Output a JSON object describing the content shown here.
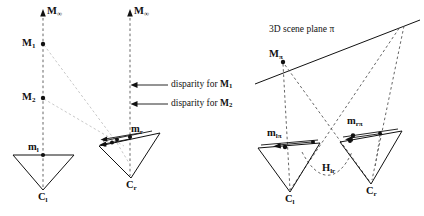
{
  "figure": {
    "background_color": "#ffffff",
    "line_color": "#111111",
    "dashed_color": "#555555",
    "faint_dashed_color": "#bbbbbb",
    "width": 424,
    "height": 216
  },
  "left_panel": {
    "labels": {
      "m_infinity_left": "M",
      "m_infinity_left_sub": "∞",
      "m_infinity_right": "M",
      "m_infinity_right_sub": "∞",
      "point_m1": "M",
      "point_m1_sub": "1",
      "point_m2": "M",
      "point_m2_sub": "2",
      "image_point_left": "m",
      "image_point_left_sub": "l",
      "image_point_right": "m",
      "image_point_right_sub": "r",
      "camera_left": "C",
      "camera_left_sub": "l",
      "camera_right": "C",
      "camera_right_sub": "r"
    },
    "annotations": [
      {
        "text": "disparity for ",
        "symbol": "M",
        "symbol_sub": "1"
      },
      {
        "text": "disparity for ",
        "symbol": "M",
        "symbol_sub": "2"
      }
    ]
  },
  "right_panel": {
    "labels": {
      "scene_plane": "3D scene plane π",
      "point_m_pi": "M",
      "point_m_pi_sub": "π",
      "image_point_lpi": "m",
      "image_point_lpi_sub": "lπ",
      "image_point_rpi": "m",
      "image_point_rpi_sub": "rπ",
      "homography": "H",
      "homography_sub": "lr",
      "camera_left": "C",
      "camera_left_sub": "l",
      "camera_right": "C",
      "camera_right_sub": "r"
    }
  },
  "geometry": {
    "left_panel": {
      "axis_left_x": 43,
      "axis_right_x": 130,
      "axis_top_y": 14,
      "camera_left_apex": [
        43,
        190
      ],
      "camera_right_apex": [
        131,
        178
      ],
      "m1": [
        43,
        44
      ],
      "m2": [
        43,
        98
      ],
      "ml": [
        43,
        154
      ],
      "mr": [
        130,
        137
      ]
    },
    "right_panel": {
      "m_pi": [
        283,
        62
      ],
      "camera_left_apex": [
        290,
        192
      ],
      "camera_right_apex": [
        371,
        184
      ],
      "m_lpi": [
        285,
        148
      ],
      "m_rpi": [
        357,
        140
      ]
    }
  }
}
